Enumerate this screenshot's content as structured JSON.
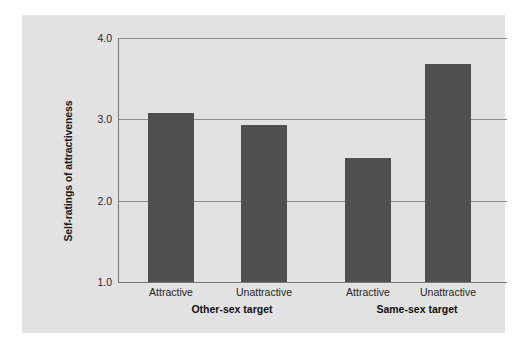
{
  "chart_data": {
    "type": "bar",
    "title": "",
    "xlabel": "",
    "ylabel": "Self-ratings of attractiveness",
    "ylim": [
      1.0,
      4.0
    ],
    "yticks": [
      "1.0",
      "2.0",
      "3.0",
      "4.0"
    ],
    "grid": "horizontal",
    "legend": "none",
    "groups": [
      {
        "label": "Other-sex target",
        "categories": [
          "Attractive",
          "Unattractive"
        ],
        "values": [
          3.08,
          2.93
        ]
      },
      {
        "label": "Same-sex target",
        "categories": [
          "Attractive",
          "Unattractive"
        ],
        "values": [
          2.52,
          3.68
        ]
      }
    ],
    "categories": [
      "Attractive",
      "Unattractive",
      "Attractive",
      "Unattractive"
    ],
    "values": [
      3.08,
      2.93,
      2.52,
      3.68
    ],
    "colors": {
      "bar": "#4f4f4f",
      "bar_shadow": "#b4b4b4",
      "panel_background": "#e2e2e2",
      "gridline": "#8c8c8c",
      "axis": "#777777",
      "text": "#262626"
    }
  }
}
